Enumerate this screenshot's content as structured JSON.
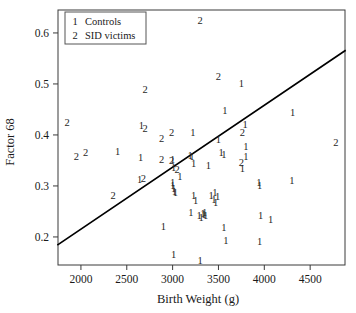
{
  "chart_data": {
    "type": "scatter",
    "title": "",
    "xlabel": "Birth Weight (g)",
    "ylabel": "Factor 68",
    "xlim": [
      1750,
      4880
    ],
    "ylim": [
      0.145,
      0.645
    ],
    "xticks": [
      2000,
      2500,
      3000,
      3500,
      4000,
      4500
    ],
    "xtick_labels": [
      "2000",
      "2500",
      "3000",
      "3500",
      "4000",
      "4500"
    ],
    "yticks": [
      0.2,
      0.3,
      0.4,
      0.5,
      0.6
    ],
    "ytick_labels": [
      "0.2",
      "0.3",
      "0.4",
      "0.5",
      "0.6"
    ],
    "grid": false,
    "legend_position": "top-left",
    "legend": [
      {
        "key": "1",
        "label": "Controls"
      },
      {
        "key": "2",
        "label": "SID victims"
      }
    ],
    "marker_style": "text-digit",
    "regression_line": {
      "x": [
        1750,
        4880
      ],
      "y": [
        0.185,
        0.565
      ]
    },
    "series": [
      {
        "name": "Controls",
        "key": "1",
        "points": [
          [
            2400,
            0.368
          ],
          [
            2660,
            0.418
          ],
          [
            2650,
            0.355
          ],
          [
            2640,
            0.312
          ],
          [
            2900,
            0.221
          ],
          [
            3000,
            0.352
          ],
          [
            3010,
            0.336
          ],
          [
            3000,
            0.306
          ],
          [
            3000,
            0.3
          ],
          [
            3010,
            0.295
          ],
          [
            3020,
            0.289
          ],
          [
            3030,
            0.288
          ],
          [
            3010,
            0.165
          ],
          [
            3080,
            0.318
          ],
          [
            3190,
            0.36
          ],
          [
            3210,
            0.358
          ],
          [
            3230,
            0.344
          ],
          [
            3220,
            0.404
          ],
          [
            3230,
            0.282
          ],
          [
            3250,
            0.272
          ],
          [
            3200,
            0.247
          ],
          [
            3290,
            0.243
          ],
          [
            3310,
            0.238
          ],
          [
            3330,
            0.246
          ],
          [
            3350,
            0.247
          ],
          [
            3340,
            0.244
          ],
          [
            3360,
            0.243
          ],
          [
            3300,
            0.153
          ],
          [
            3390,
            0.34
          ],
          [
            3420,
            0.282
          ],
          [
            3450,
            0.273
          ],
          [
            3460,
            0.287
          ],
          [
            3470,
            0.268
          ],
          [
            3490,
            0.28
          ],
          [
            3500,
            0.392
          ],
          [
            3530,
            0.365
          ],
          [
            3560,
            0.362
          ],
          [
            3570,
            0.447
          ],
          [
            3560,
            0.218
          ],
          [
            3580,
            0.194
          ],
          [
            3750,
            0.5
          ],
          [
            3760,
            0.334
          ],
          [
            3800,
            0.377
          ],
          [
            3790,
            0.42
          ],
          [
            3800,
            0.357
          ],
          [
            3940,
            0.306
          ],
          [
            3950,
            0.301
          ],
          [
            3960,
            0.243
          ],
          [
            3950,
            0.192
          ],
          [
            4070,
            0.235
          ],
          [
            4300,
            0.31
          ],
          [
            4310,
            0.445
          ]
        ]
      },
      {
        "name": "SID victims",
        "key": "2",
        "points": [
          [
            1850,
            0.424
          ],
          [
            1950,
            0.358
          ],
          [
            2050,
            0.366
          ],
          [
            2350,
            0.281
          ],
          [
            2700,
            0.489
          ],
          [
            2700,
            0.412
          ],
          [
            2680,
            0.315
          ],
          [
            2880,
            0.394
          ],
          [
            2880,
            0.352
          ],
          [
            2990,
            0.35
          ],
          [
            2990,
            0.404
          ],
          [
            3050,
            0.333
          ],
          [
            3300,
            0.625
          ],
          [
            3500,
            0.515
          ],
          [
            3760,
            0.404
          ],
          [
            3750,
            0.346
          ],
          [
            4780,
            0.385
          ]
        ]
      }
    ]
  }
}
